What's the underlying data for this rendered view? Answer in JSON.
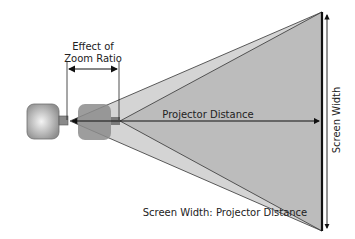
{
  "diagram": {
    "labels": {
      "zoom_effect_line1": "Effect of",
      "zoom_effect_line2": "Zoom Ratio",
      "projector_distance": "Projector Distance",
      "screen_width": "Screen Width",
      "ratio": "Screen Width: Projector Distance"
    },
    "colors": {
      "background": "#ffffff",
      "outer_cone": "#d2d2d2",
      "inner_cone": "#b9b9b9",
      "projector_body": "#a8a8a8",
      "ghost_projector": "#8a8a8a",
      "line": "#1a1a1a",
      "screen": "#111111"
    }
  }
}
